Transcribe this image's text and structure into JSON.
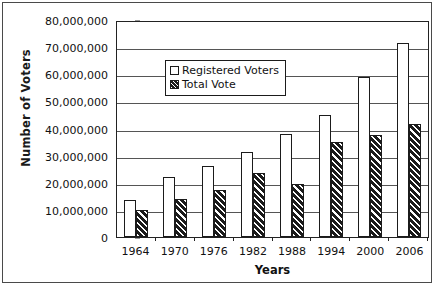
{
  "chart_data": {
    "type": "bar",
    "title": "",
    "xlabel": "Years",
    "ylabel": "Number of Voters",
    "categories": [
      "1964",
      "1970",
      "1976",
      "1982",
      "1988",
      "1994",
      "2000",
      "2006"
    ],
    "series": [
      {
        "name": "Registered Voters",
        "values": [
          13500000,
          22000000,
          26000000,
          31500000,
          38000000,
          45000000,
          59000000,
          71500000
        ]
      },
      {
        "name": "Total Vote",
        "values": [
          10000000,
          14000000,
          17500000,
          23500000,
          19500000,
          35000000,
          37500000,
          41500000
        ]
      }
    ],
    "ylim": [
      0,
      80000000
    ],
    "ytick_values": [
      0,
      10000000,
      20000000,
      30000000,
      40000000,
      50000000,
      60000000,
      70000000,
      80000000
    ],
    "ytick_labels": [
      "0",
      "10,000,000",
      "20,000,000",
      "30,000,000",
      "40,000,000",
      "50,000,000",
      "60,000,000",
      "70,000,000",
      "80,000,000"
    ],
    "grid": true,
    "legend_position": "upper-left-inside",
    "legend_entries": [
      {
        "label": "Registered Voters",
        "pattern": "hollow-white",
        "color": "#ffffff"
      },
      {
        "label": "Total Vote",
        "pattern": "diagonal-hatch-dark",
        "color": "#1b1b1b"
      }
    ]
  }
}
